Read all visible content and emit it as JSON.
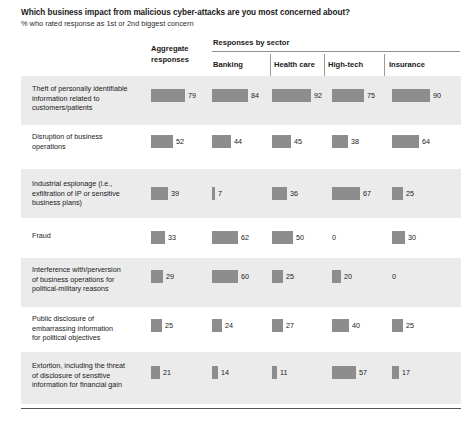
{
  "header": {
    "title": "Which business impact from malicious cyber-attacks are you most concerned about?",
    "subtitle": "% who rated response as 1st or 2nd biggest concern",
    "aggregate_label": "Aggregate\nresponses",
    "aggregate_label_line1": "Aggregate",
    "aggregate_label_line2": "responses",
    "sector_group_label": "Responses by sector"
  },
  "chart_data": {
    "type": "bar",
    "title": "Which business impact from malicious cyber-attacks are you most concerned about?",
    "subtitle": "% who rated response as 1st or 2nd biggest concern",
    "xlabel": "",
    "ylabel": "",
    "xlim": [
      0,
      100
    ],
    "grid": false,
    "legend": "none",
    "orientation": "horizontal",
    "columns": [
      "Aggregate responses",
      "Banking",
      "Health care",
      "High-tech",
      "Insurance"
    ],
    "categories": [
      "Theft of personally identifiable information related to customers/patients",
      "Disruption of business operations",
      "Industrial espionage (i.e., exfiltration of IP or sensitive business plans)",
      "Fraud",
      "Interference with/perversion of business operations for political-military reasons",
      "Public disclosure of embarrassing information for political objectives",
      "Extortion, including the threat of disclosure of sensitive information for financial gain"
    ],
    "series": [
      {
        "name": "Aggregate responses",
        "values": [
          79,
          52,
          39,
          33,
          29,
          25,
          21
        ]
      },
      {
        "name": "Banking",
        "values": [
          84,
          44,
          7,
          62,
          60,
          24,
          14
        ]
      },
      {
        "name": "Health care",
        "values": [
          92,
          45,
          36,
          50,
          25,
          27,
          11
        ]
      },
      {
        "name": "High-tech",
        "values": [
          75,
          38,
          67,
          0,
          20,
          40,
          57
        ]
      },
      {
        "name": "Insurance",
        "values": [
          90,
          64,
          25,
          30,
          0,
          25,
          17
        ]
      }
    ],
    "bar_color": "#8d8d8d",
    "shaded_row_color": "#ebebeb"
  },
  "rows": [
    {
      "label_lines": [
        "Theft of personally identifiable",
        "information related to",
        "customers/patients"
      ],
      "values": [
        79,
        84,
        92,
        75,
        90
      ]
    },
    {
      "label_lines": [
        "Disruption of business",
        "operations"
      ],
      "values": [
        52,
        44,
        45,
        38,
        64
      ]
    },
    {
      "label_lines": [
        "Industrial espionage (i.e.,",
        "exfiltration of IP or sensitive",
        "business plans)"
      ],
      "values": [
        39,
        7,
        36,
        67,
        25
      ]
    },
    {
      "label_lines": [
        "Fraud"
      ],
      "values": [
        33,
        62,
        50,
        0,
        30
      ]
    },
    {
      "label_lines": [
        "Interference with/perversion",
        "of business operations for",
        "political-military reasons"
      ],
      "values": [
        29,
        60,
        25,
        20,
        0
      ]
    },
    {
      "label_lines": [
        "Public disclosure of",
        "embarrassing information",
        "for political objectives"
      ],
      "values": [
        25,
        24,
        27,
        40,
        25
      ]
    },
    {
      "label_lines": [
        "Extortion, including the threat",
        "of disclosure of sensitive",
        "information for financial gain"
      ],
      "values": [
        21,
        14,
        11,
        57,
        17
      ]
    }
  ],
  "columns": [
    {
      "key": "aggregate",
      "label": "Aggregate responses"
    },
    {
      "key": "banking",
      "label": "Banking"
    },
    {
      "key": "health_care",
      "label": "Health care"
    },
    {
      "key": "high_tech",
      "label": "High-tech"
    },
    {
      "key": "insurance",
      "label": "Insurance"
    }
  ]
}
